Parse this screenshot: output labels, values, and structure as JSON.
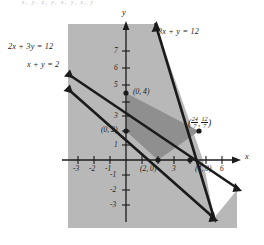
{
  "figure": {
    "top_note": "x, y, z, y,  x, y, z, y",
    "axes": {
      "x_label": "x",
      "y_label": "y"
    },
    "lines": [
      {
        "name": "line-2x-3y-12",
        "label": "2x + 3y = 12",
        "slope": -0.6667,
        "intercept": 4
      },
      {
        "name": "line-x-y-2",
        "label": "x + y = 2",
        "slope": -1.0,
        "intercept": 2
      },
      {
        "name": "line-3x-y-12",
        "label": "3x + y = 12",
        "slope": -3.0,
        "intercept": 12
      }
    ],
    "points": [
      {
        "name": "point-0-4",
        "label": "(0, 4)",
        "x": 0,
        "y": 4
      },
      {
        "name": "point-0-2",
        "label": "(0, 2)",
        "x": 0,
        "y": 2
      },
      {
        "name": "point-2-0",
        "label": "(2, 0)",
        "x": 2,
        "y": 0
      },
      {
        "name": "point-4-0",
        "label": "(4, 0)",
        "x": 4,
        "y": 0
      }
    ],
    "intersection": {
      "name": "point-24-7-12-7",
      "x_num": "24",
      "x_den": "7",
      "y_num": "12",
      "y_den": "7",
      "open_paren": "(",
      "comma": ",",
      "close_paren": ")"
    },
    "x_ticks": [
      {
        "label": "-3",
        "value": -3
      },
      {
        "label": "-2",
        "value": -2
      },
      {
        "label": "-1",
        "value": -1
      },
      {
        "label": "3",
        "value": 3
      },
      {
        "label": "6",
        "value": 6
      }
    ],
    "y_ticks": [
      {
        "label": "7",
        "value": 7
      },
      {
        "label": "6",
        "value": 6
      },
      {
        "label": "5",
        "value": 5
      },
      {
        "label": "3",
        "value": 3
      },
      {
        "label": "1",
        "value": 1
      },
      {
        "label": "-1",
        "value": -1
      },
      {
        "label": "-2",
        "value": -2
      },
      {
        "label": "-3",
        "value": -3
      }
    ],
    "colors": {
      "panel": "#b8b8b8",
      "feasible": "#8f8f8f",
      "white_wedge": "#ffffff",
      "ink": "#1b1b1b"
    }
  }
}
